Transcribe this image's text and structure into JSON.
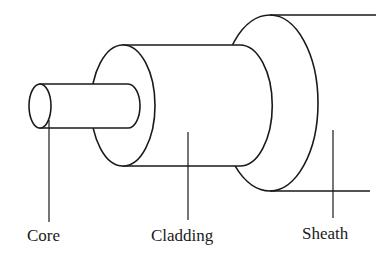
{
  "diagram": {
    "labels": {
      "core": "Core",
      "cladding": "Cladding",
      "sheath": "Sheath"
    },
    "colors": {
      "stroke": "#1a1a1a",
      "background": "#ffffff"
    }
  }
}
